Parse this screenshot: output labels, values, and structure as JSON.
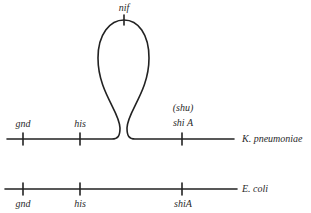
{
  "diagram": {
    "loop": {
      "label": "nif"
    },
    "k_pneumoniae": {
      "name": "K. pneumoniae",
      "markers": [
        {
          "label": "gnd"
        },
        {
          "label": "his"
        },
        {
          "label": "shi A",
          "alt_label": "(shu)"
        }
      ]
    },
    "e_coli": {
      "name": "E. coli",
      "markers": [
        {
          "label": "gnd"
        },
        {
          "label": "his"
        },
        {
          "label": "shiA"
        }
      ]
    },
    "colors": {
      "line": "#222222",
      "text": "#2a2a2a",
      "background": "#ffffff"
    }
  }
}
